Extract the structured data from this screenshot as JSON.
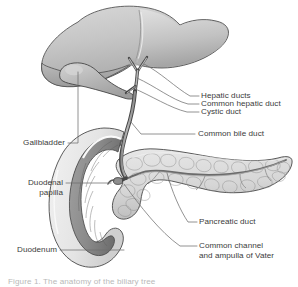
{
  "figure": {
    "background_color": "#ffffff",
    "label_color": "#3b3b3b",
    "leader_color": "#6f6f6f",
    "caption": "Figure 1. The anatomy of the biliary tree"
  },
  "labels": {
    "hepatic_ducts": "Hepatic ducts",
    "common_hepatic_duct": "Common hepatic duct",
    "cystic_duct": "Cystic duct",
    "common_bile_duct": "Common bile duct",
    "pancreatic_duct": "Pancreatic duct",
    "common_channel_line1": "Common channel",
    "common_channel_line2": "and ampulla of Vater",
    "gallbladder": "Gallbladder",
    "duodenal_papilla_line1": "Duodenal",
    "duodenal_papilla_line2": "papilla",
    "duodenum": "Duodenum"
  },
  "structures": [
    {
      "name": "liver",
      "fill": "#c9c9c9",
      "stroke": "#4a4a4a"
    },
    {
      "name": "gallbladder",
      "fill": "#b4b4b4",
      "stroke": "#3d3d3d"
    },
    {
      "name": "duodenum",
      "fill": "#ececec",
      "stroke": "#4a4a4a"
    },
    {
      "name": "duodenal-mucosa",
      "fill": "#8e8e8e",
      "stroke": "#4a4a4a"
    },
    {
      "name": "pancreas",
      "fill": "#dcdcdc",
      "stroke": "#3d3d3d"
    },
    {
      "name": "bile-duct",
      "fill": "#9a9a9a",
      "stroke": "#3d3d3d"
    }
  ]
}
